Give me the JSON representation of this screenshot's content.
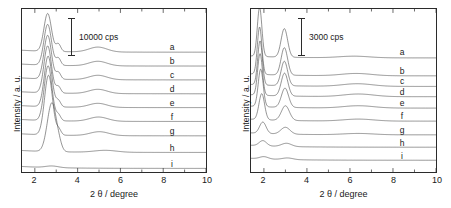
{
  "figure": {
    "panels": [
      {
        "id": "left",
        "ylabel": "Intensity / a. u.",
        "xlabel": "2 θ / degree",
        "scalebar_text": "10000 cps",
        "curve_labels": [
          "a",
          "b",
          "c",
          "d",
          "e",
          "f",
          "g",
          "h",
          "i"
        ],
        "xticks": [
          "2",
          "4",
          "6",
          "8",
          "10"
        ]
      },
      {
        "id": "right",
        "ylabel": "Intensity / a. u.",
        "xlabel": "2 θ / degree",
        "scalebar_text": "3000 cps",
        "curve_labels": [
          "a",
          "b",
          "c",
          "d",
          "e",
          "f",
          "g",
          "h",
          "i"
        ],
        "xticks": [
          "2",
          "4",
          "6",
          "8",
          "10"
        ]
      }
    ]
  },
  "chart_data": [
    {
      "type": "line",
      "title": "",
      "xlabel": "2 θ / degree",
      "ylabel": "Intensity / a. u.",
      "xlim": [
        1.4,
        10
      ],
      "ylim": [
        0,
        1
      ],
      "grid": false,
      "legend": "inline-right",
      "scalebar": {
        "label": "10000 cps",
        "value": 10000,
        "units": "cps"
      },
      "ytick_labels": [],
      "xtick_labels": [
        "2",
        "4",
        "6",
        "8",
        "10"
      ],
      "xticks": [
        2,
        4,
        6,
        8,
        10
      ],
      "note": "Stacked small-angle XRD patterns, curves offset vertically; sharp (100) peak near 2.6 degrees with shoulder near 3.1 and broad feature near 5.",
      "series": [
        {
          "name": "a",
          "offset": 0.735,
          "peaks": [
            {
              "x": 2.6,
              "height": 0.232,
              "width": 0.175
            },
            {
              "x": 3.1,
              "height": 0.046,
              "width": 0.11
            },
            {
              "x": 4.95,
              "height": 0.03,
              "width": 0.42
            }
          ]
        },
        {
          "name": "b",
          "offset": 0.65,
          "peaks": [
            {
              "x": 2.6,
              "height": 0.25,
              "width": 0.175
            },
            {
              "x": 3.1,
              "height": 0.044,
              "width": 0.11
            },
            {
              "x": 4.95,
              "height": 0.028,
              "width": 0.42
            }
          ]
        },
        {
          "name": "c",
          "offset": 0.565,
          "peaks": [
            {
              "x": 2.6,
              "height": 0.268,
              "width": 0.175
            },
            {
              "x": 3.1,
              "height": 0.042,
              "width": 0.11
            },
            {
              "x": 4.95,
              "height": 0.027,
              "width": 0.42
            }
          ]
        },
        {
          "name": "d",
          "offset": 0.48,
          "peaks": [
            {
              "x": 2.6,
              "height": 0.288,
              "width": 0.175
            },
            {
              "x": 3.1,
              "height": 0.04,
              "width": 0.11
            },
            {
              "x": 4.95,
              "height": 0.026,
              "width": 0.42
            }
          ]
        },
        {
          "name": "e",
          "offset": 0.395,
          "peaks": [
            {
              "x": 2.62,
              "height": 0.31,
              "width": 0.178
            },
            {
              "x": 3.1,
              "height": 0.038,
              "width": 0.11
            },
            {
              "x": 4.95,
              "height": 0.025,
              "width": 0.42
            }
          ]
        },
        {
          "name": "f",
          "offset": 0.31,
          "peaks": [
            {
              "x": 2.62,
              "height": 0.336,
              "width": 0.182
            },
            {
              "x": 3.1,
              "height": 0.036,
              "width": 0.11
            },
            {
              "x": 4.98,
              "height": 0.026,
              "width": 0.43
            }
          ]
        },
        {
          "name": "g",
          "offset": 0.222,
          "peaks": [
            {
              "x": 2.64,
              "height": 0.366,
              "width": 0.188
            },
            {
              "x": 3.12,
              "height": 0.034,
              "width": 0.11
            },
            {
              "x": 5.02,
              "height": 0.024,
              "width": 0.44
            }
          ]
        },
        {
          "name": "h",
          "offset": 0.12,
          "peaks": [
            {
              "x": 2.8,
              "height": 0.3,
              "width": 0.215
            },
            {
              "x": 3.15,
              "height": 0.022,
              "width": 0.12
            },
            {
              "x": 5.3,
              "height": 0.012,
              "width": 0.52
            }
          ]
        },
        {
          "name": "i",
          "offset": 0.022,
          "peaks": [
            {
              "x": 2.8,
              "height": 0.01,
              "width": 0.3
            }
          ]
        }
      ]
    },
    {
      "type": "line",
      "title": "",
      "xlabel": "2 θ / degree",
      "ylabel": "Intensity / a. u.",
      "xlim": [
        1.4,
        10
      ],
      "ylim": [
        0,
        1
      ],
      "grid": false,
      "legend": "inline-right",
      "scalebar": {
        "label": "3000 cps",
        "value": 3000,
        "units": "cps"
      },
      "ytick_labels": [],
      "xtick_labels": [
        "2",
        "4",
        "6",
        "8",
        "10"
      ],
      "xticks": [
        2,
        4,
        6,
        8,
        10
      ],
      "note": "Stacked small-angle XRD patterns with two main reflections near 1.8 and 3.0 degrees, decreasing from a to i.",
      "series": [
        {
          "name": "a",
          "offset": 0.7,
          "peaks": [
            {
              "x": 1.8,
              "height": 0.3,
              "width": 0.105
            },
            {
              "x": 2.95,
              "height": 0.175,
              "width": 0.15
            },
            {
              "x": 6.2,
              "height": 0.01,
              "width": 0.7
            }
          ]
        },
        {
          "name": "b",
          "offset": 0.59,
          "peaks": [
            {
              "x": 1.8,
              "height": 0.29,
              "width": 0.105
            },
            {
              "x": 2.95,
              "height": 0.168,
              "width": 0.15
            },
            {
              "x": 6.3,
              "height": 0.014,
              "width": 0.7
            }
          ]
        },
        {
          "name": "c",
          "offset": 0.525,
          "peaks": [
            {
              "x": 1.82,
              "height": 0.27,
              "width": 0.108
            },
            {
              "x": 2.95,
              "height": 0.15,
              "width": 0.152
            },
            {
              "x": 6.35,
              "height": 0.016,
              "width": 0.7
            }
          ]
        },
        {
          "name": "d",
          "offset": 0.462,
          "peaks": [
            {
              "x": 1.82,
              "height": 0.255,
              "width": 0.11
            },
            {
              "x": 2.96,
              "height": 0.14,
              "width": 0.155
            },
            {
              "x": 6.4,
              "height": 0.016,
              "width": 0.7
            }
          ]
        },
        {
          "name": "e",
          "offset": 0.392,
          "peaks": [
            {
              "x": 1.85,
              "height": 0.23,
              "width": 0.115
            },
            {
              "x": 2.98,
              "height": 0.118,
              "width": 0.165
            },
            {
              "x": 6.4,
              "height": 0.014,
              "width": 0.7
            }
          ]
        },
        {
          "name": "f",
          "offset": 0.312,
          "peaks": [
            {
              "x": 1.9,
              "height": 0.16,
              "width": 0.13
            },
            {
              "x": 3.0,
              "height": 0.09,
              "width": 0.185
            },
            {
              "x": 6.4,
              "height": 0.012,
              "width": 0.7
            }
          ]
        },
        {
          "name": "g",
          "offset": 0.228,
          "peaks": [
            {
              "x": 1.95,
              "height": 0.07,
              "width": 0.15
            },
            {
              "x": 3.0,
              "height": 0.042,
              "width": 0.21
            },
            {
              "x": 6.4,
              "height": 0.008,
              "width": 0.7
            }
          ]
        },
        {
          "name": "h",
          "offset": 0.152,
          "peaks": [
            {
              "x": 1.95,
              "height": 0.032,
              "width": 0.17
            },
            {
              "x": 3.05,
              "height": 0.02,
              "width": 0.23
            }
          ]
        },
        {
          "name": "i",
          "offset": 0.072,
          "peaks": [
            {
              "x": 2.0,
              "height": 0.014,
              "width": 0.2
            },
            {
              "x": 3.1,
              "height": 0.01,
              "width": 0.25
            }
          ]
        }
      ]
    }
  ]
}
